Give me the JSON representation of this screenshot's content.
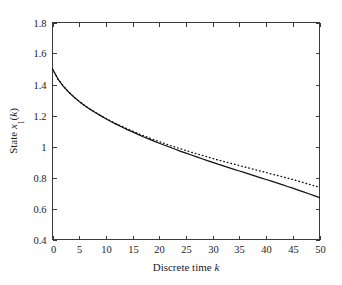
{
  "figure": {
    "background_color": "#ffffff",
    "line_color": "#111111",
    "axis_color": "#3a3a3a"
  },
  "axes": {
    "x_title_prefix": "Discrete time ",
    "x_title_symbol": "k",
    "y_title_prefix": "State ",
    "y_title_symbol": "x",
    "y_title_subscript": "1",
    "y_title_suffix_open": "(",
    "y_title_suffix_symbol": "k",
    "y_title_suffix_close": ")",
    "x_tick_labels": [
      "0",
      "5",
      "10",
      "15",
      "20",
      "25",
      "30",
      "35",
      "40",
      "45",
      "50"
    ],
    "y_tick_labels": [
      "0.4",
      "0.6",
      "0.8",
      "1",
      "1.2",
      "1.4",
      "1.6",
      "1.8"
    ]
  },
  "chart_data": {
    "type": "line",
    "title": "",
    "xlabel": "Discrete time k",
    "ylabel": "State x_1(k)",
    "xlim": [
      0,
      50
    ],
    "ylim": [
      0.4,
      1.8
    ],
    "xticks": [
      0,
      5,
      10,
      15,
      20,
      25,
      30,
      35,
      40,
      45,
      50
    ],
    "yticks": [
      0.4,
      0.6,
      0.8,
      1.0,
      1.2,
      1.4,
      1.6,
      1.8
    ],
    "grid": false,
    "legend": null,
    "series": [
      {
        "name": "solid",
        "style": "solid",
        "color": "#111111",
        "x": [
          0,
          1,
          2,
          3,
          4,
          5,
          6,
          7,
          8,
          9,
          10,
          11,
          12,
          13,
          14,
          15,
          16,
          17,
          18,
          19,
          20,
          21,
          22,
          23,
          24,
          25,
          26,
          27,
          28,
          29,
          30,
          31,
          32,
          33,
          34,
          35,
          36,
          37,
          38,
          39,
          40,
          41,
          42,
          43,
          44,
          45,
          46,
          47,
          48,
          49,
          50
        ],
        "values": [
          1.5,
          1.437,
          1.39,
          1.352,
          1.32,
          1.291,
          1.265,
          1.241,
          1.219,
          1.199,
          1.179,
          1.16,
          1.143,
          1.126,
          1.109,
          1.094,
          1.078,
          1.063,
          1.049,
          1.035,
          1.021,
          1.008,
          0.995,
          0.982,
          0.969,
          0.957,
          0.945,
          0.933,
          0.921,
          0.909,
          0.898,
          0.886,
          0.875,
          0.864,
          0.853,
          0.842,
          0.831,
          0.82,
          0.809,
          0.798,
          0.787,
          0.776,
          0.765,
          0.754,
          0.742,
          0.731,
          0.719,
          0.707,
          0.695,
          0.683,
          0.67
        ]
      },
      {
        "name": "dotted",
        "style": "dotted",
        "color": "#111111",
        "x": [
          0,
          1,
          2,
          3,
          4,
          5,
          6,
          7,
          8,
          9,
          10,
          11,
          12,
          13,
          14,
          15,
          16,
          17,
          18,
          19,
          20,
          21,
          22,
          23,
          24,
          25,
          26,
          27,
          28,
          29,
          30,
          31,
          32,
          33,
          34,
          35,
          36,
          37,
          38,
          39,
          40,
          41,
          42,
          43,
          44,
          45,
          46,
          47,
          48,
          49,
          50
        ],
        "values": [
          1.5,
          1.437,
          1.39,
          1.352,
          1.32,
          1.291,
          1.265,
          1.242,
          1.22,
          1.2,
          1.181,
          1.163,
          1.146,
          1.13,
          1.114,
          1.099,
          1.084,
          1.07,
          1.057,
          1.044,
          1.031,
          1.019,
          1.007,
          0.996,
          0.985,
          0.974,
          0.963,
          0.953,
          0.943,
          0.933,
          0.923,
          0.913,
          0.904,
          0.895,
          0.886,
          0.877,
          0.868,
          0.859,
          0.85,
          0.841,
          0.832,
          0.823,
          0.814,
          0.805,
          0.796,
          0.787,
          0.777,
          0.767,
          0.757,
          0.747,
          0.736
        ]
      }
    ]
  }
}
